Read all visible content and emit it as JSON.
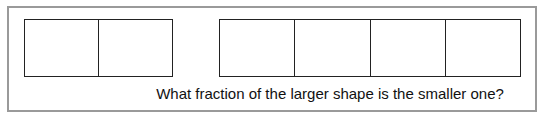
{
  "question": "What fraction of the larger shape is the smaller one?",
  "shapes": {
    "smaller": {
      "cells": 2
    },
    "larger": {
      "cells": 4
    }
  }
}
